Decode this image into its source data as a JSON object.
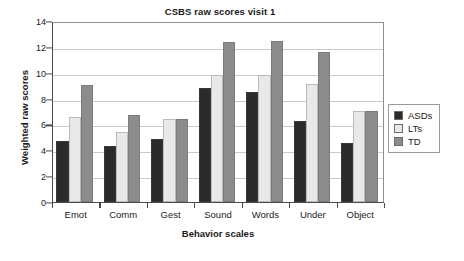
{
  "chart_data": {
    "type": "bar",
    "title": "CSBS raw scores visit 1",
    "xlabel": "Behavior scales",
    "ylabel": "Weighted raw scores",
    "categories": [
      "Emot",
      "Comm",
      "Gest",
      "Sound",
      "Words",
      "Under",
      "Object"
    ],
    "series": [
      {
        "name": "ASDs",
        "color": "#2b2b2b",
        "values": [
          4.75,
          4.3,
          4.85,
          8.85,
          8.5,
          6.25,
          4.55
        ]
      },
      {
        "name": "LTs",
        "color": "#e8e8e8",
        "values": [
          6.55,
          5.45,
          6.45,
          9.85,
          9.85,
          9.15,
          7.05
        ]
      },
      {
        "name": "TD",
        "color": "#8c8c8c",
        "values": [
          9.05,
          6.7,
          6.45,
          12.4,
          12.45,
          11.6,
          7.05
        ]
      }
    ],
    "ylim": [
      0,
      14
    ],
    "ytick_step": 2,
    "yticks": [
      "0",
      "2",
      "4",
      "6",
      "8",
      "10",
      "12",
      "14"
    ],
    "grid": "horizontal",
    "legend_position": "right",
    "legend_entries": [
      "ASDs",
      "LTs",
      "TD"
    ]
  }
}
